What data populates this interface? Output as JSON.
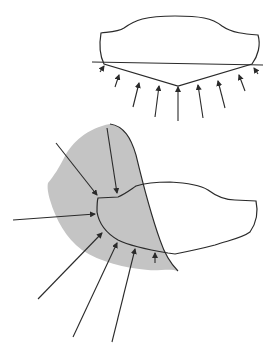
{
  "figure": {
    "colors": {
      "background": "#ffffff",
      "stroke": "#2a2a2a",
      "shaded_region": "#c4c4c4"
    },
    "top_panel": {
      "arrow_count": 9,
      "has_reference_line": true
    },
    "bottom_panel": {
      "arrow_count": 7,
      "has_shaded_region": true
    }
  }
}
